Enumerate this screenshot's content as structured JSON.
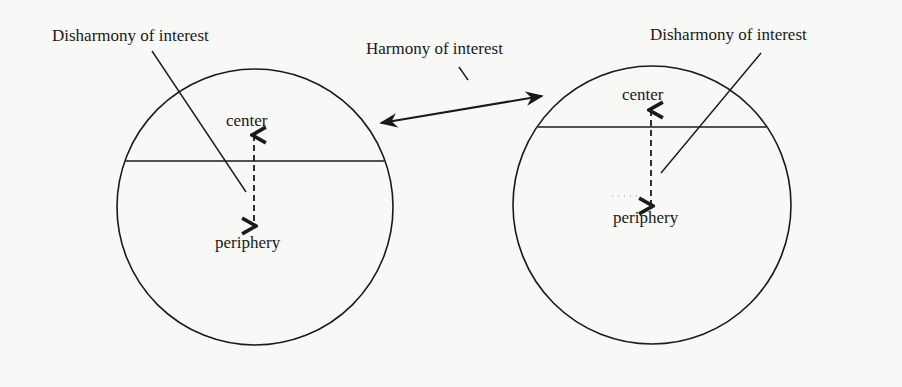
{
  "diagram": {
    "colors": {
      "stroke": "#1a1a1a",
      "background": "#f8f8f6"
    },
    "center_label": "Harmony of interest",
    "left_system": {
      "label": "Disharmony of interest",
      "center": "center",
      "periphery": "periphery"
    },
    "right_system": {
      "label": "Disharmony of interest",
      "center": "center",
      "periphery": "periphery"
    },
    "relations": [
      {
        "from": "left_system.center",
        "to": "right_system.center",
        "type": "harmony",
        "arrow": "double"
      },
      {
        "from": "left_system.center",
        "to": "left_system.periphery",
        "type": "disharmony",
        "arrow": "dashed-double"
      },
      {
        "from": "right_system.center",
        "to": "right_system.periphery",
        "type": "disharmony",
        "arrow": "dashed-double"
      }
    ]
  }
}
